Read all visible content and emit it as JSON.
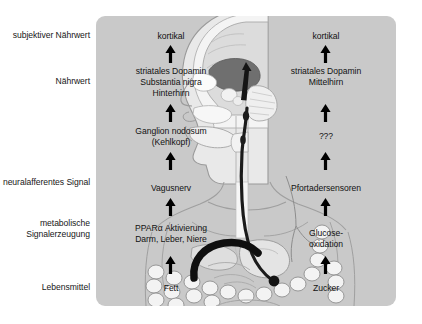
{
  "figure": {
    "panel_color": "#c9c9c9",
    "background_color": "#ffffff",
    "arrow_color": "#000000",
    "vagus_nerve_color": "#1a1a1a"
  },
  "row_labels": [
    {
      "id": "subjective-nutritional-value",
      "text": "subjektiver\nNährwert"
    },
    {
      "id": "nutritional-value",
      "text": "Nährwert"
    },
    {
      "id": "neural-afferent-signal",
      "text": "neuralafferentes\nSignal"
    },
    {
      "id": "metabolic-signal-generation",
      "text": "metabolische\nSignalerzeugung"
    },
    {
      "id": "food",
      "text": "Lebensmittel"
    }
  ],
  "left_pathway": {
    "name": "Fett-Pfad",
    "nodes": [
      {
        "id": "kortikal-left",
        "text": "kortikal"
      },
      {
        "id": "striatales-dopamin-left",
        "text": "striatales Dopamin\nSubstantia nigra\nHinterhirn"
      },
      {
        "id": "ganglion-nodosum",
        "text": "Ganglion nodosum\n(Kehlkopf)"
      },
      {
        "id": "vagusnerv",
        "text": "Vagusnerv"
      },
      {
        "id": "ppar-alpha",
        "text": "PPARα Aktivierung\nDarm, Leber, Niere"
      },
      {
        "id": "fett",
        "text": "Fett"
      }
    ]
  },
  "right_pathway": {
    "name": "Zucker-Pfad",
    "nodes": [
      {
        "id": "kortikal-right",
        "text": "kortikal"
      },
      {
        "id": "striatales-dopamin-right",
        "text": "striatales Dopamin\nMittelhirn"
      },
      {
        "id": "unknown-node",
        "text": "???"
      },
      {
        "id": "pfortadersensoren",
        "text": "Pfortadersensoren"
      },
      {
        "id": "glucose-oxidation",
        "text": "Glucose-\noxidation"
      },
      {
        "id": "zucker",
        "text": "Zucker"
      }
    ]
  },
  "anatomy": {
    "description": "Sagittalschnitt Kopf mit Gehirn, Körper mit Magen und Darm",
    "parts": [
      {
        "id": "head-sagittal",
        "label": "Kopf Sagittalschnitt"
      },
      {
        "id": "brain-striatum",
        "label": "Striatum"
      },
      {
        "id": "cerebellum",
        "label": "Kleinhirn"
      },
      {
        "id": "torso-outline",
        "label": "Körperumriss"
      },
      {
        "id": "esophagus",
        "label": "Speiseröhre"
      },
      {
        "id": "stomach",
        "label": "Magen"
      },
      {
        "id": "intestine",
        "label": "Darm"
      },
      {
        "id": "vagus-nerve",
        "label": "Vagusnerv"
      },
      {
        "id": "portal-vein",
        "label": "Pfortader"
      }
    ]
  }
}
